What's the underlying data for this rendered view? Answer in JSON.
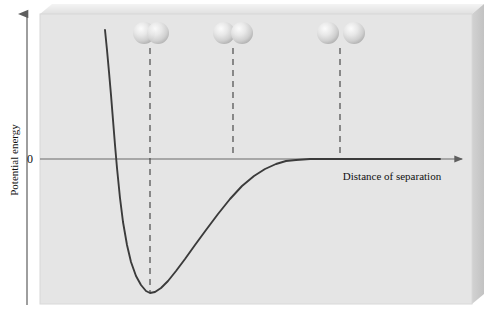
{
  "figure": {
    "type": "potential-energy-curve",
    "y_axis_label": "Potential energy",
    "x_axis_label": "Distance of separation",
    "zero_tick_label": "0",
    "background_color": "#e6e6e6",
    "panel_color": "#e4e4e4",
    "curve_color": "#3b3b3b",
    "axis_color": "#6a6a6a",
    "dash_color": "#4a4a4a",
    "sphere_color": "#dcdcdc"
  },
  "panel": {
    "x": 40,
    "y": 14,
    "width": 432,
    "height": 290,
    "bevel_top": 10,
    "bevel_right": 12
  },
  "y_axis": {
    "x": 27,
    "top": 10,
    "bottom": 305
  },
  "x_axis": {
    "y": 159,
    "left": 40,
    "right": 470
  },
  "chart_data": {
    "type": "line",
    "title": "",
    "xlabel": "Distance of separation",
    "ylabel": "Potential energy",
    "zero_level": 0,
    "grid": false,
    "legend": false,
    "annotations": [
      {
        "label": "0",
        "x": 33,
        "y": 163
      },
      {
        "label": "Distance of separation",
        "x": 392,
        "y": 180
      },
      {
        "label": "Potential energy",
        "x": 18,
        "y": 160,
        "rotation": -90
      }
    ],
    "curve_points": [
      [
        105,
        30
      ],
      [
        107,
        50
      ],
      [
        109,
        72
      ],
      [
        111,
        95
      ],
      [
        113,
        120
      ],
      [
        115,
        145
      ],
      [
        117,
        168
      ],
      [
        120,
        198
      ],
      [
        123,
        222
      ],
      [
        127,
        245
      ],
      [
        131,
        262
      ],
      [
        136,
        276
      ],
      [
        141,
        285
      ],
      [
        146,
        291
      ],
      [
        150,
        293
      ],
      [
        155,
        292
      ],
      [
        161,
        288
      ],
      [
        168,
        281
      ],
      [
        176,
        271
      ],
      [
        185,
        259
      ],
      [
        195,
        245
      ],
      [
        206,
        230
      ],
      [
        218,
        214
      ],
      [
        230,
        199
      ],
      [
        242,
        186
      ],
      [
        254,
        176
      ],
      [
        265,
        169
      ],
      [
        276,
        164
      ],
      [
        286,
        161
      ],
      [
        296,
        160
      ],
      [
        310,
        159
      ],
      [
        330,
        159
      ],
      [
        360,
        159
      ],
      [
        400,
        159
      ],
      [
        440,
        159
      ]
    ],
    "minimum": {
      "x": 150,
      "y": 293
    },
    "zero_crossing": {
      "x": 114,
      "y": 159
    },
    "markers": [
      {
        "name": "bonded-overlap",
        "dash_x": 150,
        "dash_top": 48,
        "dash_bottom": 292,
        "spheres": [
          {
            "cx": 144,
            "cy": 33,
            "r": 11
          },
          {
            "cx": 158,
            "cy": 33,
            "r": 11
          }
        ]
      },
      {
        "name": "touching",
        "dash_x": 233,
        "dash_top": 48,
        "dash_bottom": 158,
        "spheres": [
          {
            "cx": 224,
            "cy": 33,
            "r": 11
          },
          {
            "cx": 242,
            "cy": 33,
            "r": 11
          }
        ]
      },
      {
        "name": "separated",
        "dash_x": 340,
        "dash_top": 48,
        "dash_bottom": 158,
        "spheres": [
          {
            "cx": 328,
            "cy": 33,
            "r": 11
          },
          {
            "cx": 354,
            "cy": 33,
            "r": 11
          }
        ]
      }
    ]
  }
}
